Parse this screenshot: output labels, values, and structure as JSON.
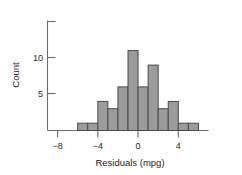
{
  "chart_data": {
    "type": "bar",
    "title": "",
    "subtitle": "",
    "xlabel": "Residuals (mpg)",
    "ylabel": "Count",
    "grid": false,
    "legend": null,
    "bin_width": 1,
    "xlim": [
      -9,
      7
    ],
    "ylim": [
      0,
      15
    ],
    "x_ticks": [
      -8,
      -4,
      0,
      4
    ],
    "x_tick_labels": [
      "−8",
      "−4",
      "0",
      "4"
    ],
    "y_ticks": [
      5,
      10,
      15
    ],
    "y_tick_labels": [
      "5",
      "10",
      ""
    ],
    "categories": [
      "-6",
      "-5",
      "-4",
      "-3",
      "-2",
      "-1",
      "0",
      "1",
      "2",
      "3",
      "4",
      "5"
    ],
    "bin_edges": [
      -6,
      -5,
      -4,
      -3,
      -2,
      -1,
      0,
      1,
      2,
      3,
      4,
      5,
      6
    ],
    "values": [
      1,
      1,
      4,
      3,
      6,
      11,
      6,
      9,
      3,
      4,
      1,
      1
    ],
    "bars": [
      {
        "x0": -6,
        "x1": -5,
        "count": 1
      },
      {
        "x0": -5,
        "x1": -4,
        "count": 1
      },
      {
        "x0": -4,
        "x1": -3,
        "count": 4
      },
      {
        "x0": -3,
        "x1": -2,
        "count": 3
      },
      {
        "x0": -2,
        "x1": -1,
        "count": 6
      },
      {
        "x0": -1,
        "x1": 0,
        "count": 11
      },
      {
        "x0": 0,
        "x1": 1,
        "count": 6
      },
      {
        "x0": 1,
        "x1": 2,
        "count": 9
      },
      {
        "x0": 2,
        "x1": 3,
        "count": 3
      },
      {
        "x0": 3,
        "x1": 4,
        "count": 4
      },
      {
        "x0": 4,
        "x1": 5,
        "count": 1
      },
      {
        "x0": 5,
        "x1": 6,
        "count": 1
      }
    ],
    "colors": {
      "bar_fill": "#9c9c9c",
      "bar_stroke": "#4a4a4a",
      "axis": "#6e6e6e",
      "text": "#1d1d1d",
      "background": "#ffffff"
    }
  },
  "figure": {
    "xaxis_title": "Residuals (mpg)",
    "yaxis_title": "Count",
    "x_tick_labels": [
      "−8",
      "−4",
      "0",
      "4"
    ],
    "y_tick_labels": [
      "10",
      "5"
    ]
  }
}
